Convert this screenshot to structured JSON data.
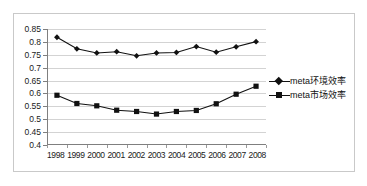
{
  "chart_data": {
    "type": "line",
    "title": "",
    "xlabel": "",
    "ylabel": "",
    "ylim": [
      0.4,
      0.85
    ],
    "ytick_step": 0.05,
    "yticks": [
      "0.85",
      "0.8",
      "0.75",
      "0.7",
      "0.65",
      "0.6",
      "0.55",
      "0.5",
      "0.45",
      "0.4"
    ],
    "grid": true,
    "legend_position": "right",
    "categories": [
      "1998",
      "1999",
      "2000",
      "2001",
      "2002",
      "2003",
      "2004",
      "2005",
      "2006",
      "2007",
      "2008"
    ],
    "series": [
      {
        "name": "meta环境效率",
        "marker": "diamond",
        "color": "#111111",
        "values": [
          0.818,
          0.773,
          0.757,
          0.762,
          0.746,
          0.757,
          0.759,
          0.782,
          0.76,
          0.781,
          0.801
        ]
      },
      {
        "name": "meta市场效率",
        "marker": "square",
        "color": "#111111",
        "values": [
          0.593,
          0.561,
          0.552,
          0.535,
          0.53,
          0.52,
          0.53,
          0.534,
          0.56,
          0.597,
          0.628
        ]
      }
    ]
  },
  "legend": {
    "items": [
      {
        "label": "meta环境效率",
        "marker": "diamond-marker-icon"
      },
      {
        "label": "meta市场效率",
        "marker": "square-marker-icon"
      }
    ]
  }
}
